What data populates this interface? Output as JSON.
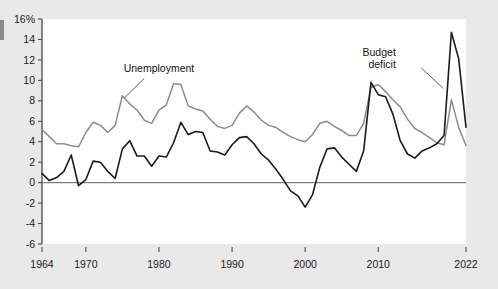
{
  "figure": {
    "background_color": "#e9e9e9",
    "plot_background_color": "#ffffff"
  },
  "chart_data": {
    "type": "line",
    "title": "",
    "subtitle": "",
    "xlabel": "",
    "ylabel": "",
    "xlim": [
      1964,
      2022
    ],
    "ylim": [
      -6,
      16
    ],
    "grid": false,
    "legend_position": "inline-annotations",
    "y_ticks": [
      16,
      14,
      12,
      10,
      8,
      6,
      4,
      2,
      0,
      -2,
      -4,
      -6
    ],
    "y_tick_labels": [
      "16%",
      "14",
      "12",
      "10",
      "8",
      "6",
      "4",
      "2",
      "0",
      "-2",
      "-4",
      "-6"
    ],
    "x_ticks": [
      1964,
      1970,
      1980,
      1990,
      2000,
      2010,
      2022
    ],
    "x_tick_labels": [
      "1964",
      "1970",
      "1980",
      "1990",
      "2000",
      "2010",
      "2022"
    ],
    "zero_line": 0,
    "annotations": [
      {
        "name": "unemployment-annotation",
        "text_line_1": "Unemployment",
        "text_line_2": "",
        "x_text": 1980.0,
        "y_text": 10.8,
        "leader_from_x": 1978.0,
        "leader_from_y": 10.2,
        "leader_to_x": 1975.3,
        "leader_to_y": 8.3
      },
      {
        "name": "budget-deficit-annotation",
        "text_line_1": "Budget",
        "text_line_2": "deficit",
        "x_text": 2012.4,
        "y_text": 12.4,
        "leader_from_x": 2015.9,
        "leader_from_y": 11.2,
        "leader_to_x": 2018.9,
        "leader_to_y": 9.2
      }
    ],
    "series": [
      {
        "name": "Unemployment",
        "color": "#8c8c8c",
        "x": [
          1964,
          1965,
          1966,
          1967,
          1968,
          1969,
          1970,
          1971,
          1972,
          1973,
          1974,
          1975,
          1976,
          1977,
          1978,
          1979,
          1980,
          1981,
          1982,
          1983,
          1984,
          1985,
          1986,
          1987,
          1988,
          1989,
          1990,
          1991,
          1992,
          1993,
          1994,
          1995,
          1996,
          1997,
          1998,
          1999,
          2000,
          2001,
          2002,
          2003,
          2004,
          2005,
          2006,
          2007,
          2008,
          2009,
          2010,
          2011,
          2012,
          2013,
          2014,
          2015,
          2016,
          2017,
          2018,
          2019,
          2020,
          2021,
          2022
        ],
        "values": [
          5.2,
          4.5,
          3.8,
          3.8,
          3.6,
          3.5,
          4.9,
          5.9,
          5.6,
          4.9,
          5.6,
          8.5,
          7.7,
          7.1,
          6.1,
          5.8,
          7.1,
          7.6,
          9.7,
          9.6,
          7.5,
          7.2,
          7.0,
          6.2,
          5.5,
          5.3,
          5.6,
          6.8,
          7.5,
          6.9,
          6.1,
          5.6,
          5.4,
          4.9,
          4.5,
          4.2,
          4.0,
          4.7,
          5.8,
          6.0,
          5.5,
          5.1,
          4.6,
          4.6,
          5.8,
          9.3,
          9.6,
          8.9,
          8.1,
          7.4,
          6.2,
          5.3,
          4.9,
          4.4,
          3.9,
          3.7,
          8.1,
          5.4,
          3.6
        ]
      },
      {
        "name": "Budget deficit",
        "color": "#1b1b1b",
        "x": [
          1964,
          1965,
          1966,
          1967,
          1968,
          1969,
          1970,
          1971,
          1972,
          1973,
          1974,
          1975,
          1976,
          1977,
          1978,
          1979,
          1980,
          1981,
          1982,
          1983,
          1984,
          1985,
          1986,
          1987,
          1988,
          1989,
          1990,
          1991,
          1992,
          1993,
          1994,
          1995,
          1996,
          1997,
          1998,
          1999,
          2000,
          2001,
          2002,
          2003,
          2004,
          2005,
          2006,
          2007,
          2008,
          2009,
          2010,
          2011,
          2012,
          2013,
          2014,
          2015,
          2016,
          2017,
          2018,
          2019,
          2020,
          2021,
          2022
        ],
        "values": [
          0.9,
          0.2,
          0.5,
          1.1,
          2.7,
          -0.3,
          0.3,
          2.1,
          2.0,
          1.1,
          0.4,
          3.3,
          4.1,
          2.6,
          2.6,
          1.6,
          2.6,
          2.5,
          3.9,
          5.9,
          4.7,
          5.0,
          4.9,
          3.1,
          3.0,
          2.7,
          3.7,
          4.4,
          4.5,
          3.8,
          2.8,
          2.2,
          1.3,
          0.3,
          -0.8,
          -1.3,
          -2.4,
          -1.2,
          1.5,
          3.3,
          3.4,
          2.5,
          1.8,
          1.1,
          3.1,
          9.8,
          8.6,
          8.4,
          6.7,
          4.1,
          2.8,
          2.4,
          3.1,
          3.4,
          3.8,
          4.6,
          14.7,
          12.1,
          5.4
        ]
      }
    ]
  },
  "axis": {
    "y_unit_suffix": "%"
  }
}
